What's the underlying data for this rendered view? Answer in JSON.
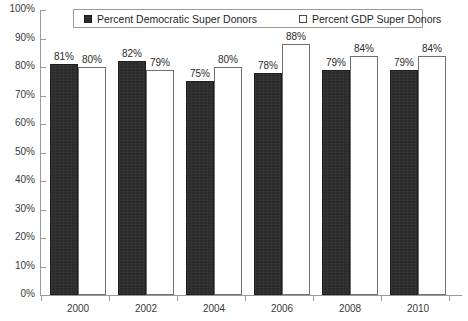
{
  "chart_data": {
    "type": "bar",
    "title": "",
    "xlabel": "",
    "ylabel": "",
    "ylim": [
      0,
      100
    ],
    "grid": false,
    "legend_position": "top-center",
    "categories": [
      "2000",
      "2002",
      "2004",
      "2006",
      "2008",
      "2010"
    ],
    "y_ticks": [
      "0%",
      "10%",
      "20%",
      "30%",
      "40%",
      "50%",
      "60%",
      "70%",
      "80%",
      "90%",
      "100%"
    ],
    "y_tick_values": [
      0,
      10,
      20,
      30,
      40,
      50,
      60,
      70,
      80,
      90,
      100
    ],
    "series": [
      {
        "name": "Percent Democratic Super Donors",
        "color": "#2b2b2b",
        "values": [
          81,
          82,
          75,
          78,
          79,
          79
        ],
        "labels": [
          "81%",
          "82%",
          "75%",
          "78%",
          "79%",
          "79%"
        ]
      },
      {
        "name": "Percent GDP Super Donors",
        "color": "#ffffff",
        "values": [
          80,
          79,
          80,
          88,
          84,
          84
        ],
        "labels": [
          "80%",
          "79%",
          "80%",
          "88%",
          "84%",
          "84%"
        ]
      }
    ]
  },
  "legend": {
    "entries": [
      {
        "label": "Percent Democratic Super Donors",
        "swatch": "filled-square-icon"
      },
      {
        "label": "Percent GDP Super Donors",
        "swatch": "hollow-square-icon"
      }
    ]
  },
  "colors": {
    "democratic_bar": "#2b2b2b",
    "gdp_bar": "#ffffff",
    "gdp_bar_border": "#6f6f6f",
    "axis": "#9a9a9a",
    "text": "#2a2a2a",
    "background": "#ffffff"
  }
}
